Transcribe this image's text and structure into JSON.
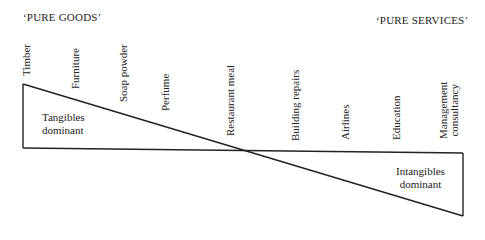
{
  "header": {
    "left_label": "‘PURE GOODS’",
    "right_label": "‘PURE SERVICES’"
  },
  "spectrum_items": [
    {
      "label": "Timber"
    },
    {
      "label": "Furniture"
    },
    {
      "label": "Soap powder"
    },
    {
      "label": "Perfume"
    },
    {
      "label": "Restaurant meal"
    },
    {
      "label": "Building repairs"
    },
    {
      "label": "Airlines"
    },
    {
      "label": "Education"
    },
    {
      "label": "Management",
      "label2": "consultancy"
    }
  ],
  "regions": {
    "tangibles": {
      "line1": "Tangibles",
      "line2": "dominant"
    },
    "intangibles": {
      "line1": "Intangibles",
      "line2": "dominant"
    }
  },
  "colors": {
    "line": "#222222",
    "background": "#ffffff"
  }
}
